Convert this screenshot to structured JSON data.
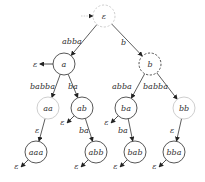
{
  "diagram": {
    "type": "tree",
    "colors": {
      "edge": "#333333",
      "node_dark": "#444444",
      "node_light": "#c8c8c8",
      "text": "#333333"
    },
    "nodes": [
      {
        "id": "eps",
        "label": "ε",
        "x": 104,
        "y": 16,
        "r": 11,
        "style": "dashed-light",
        "initial": true
      },
      {
        "id": "a",
        "label": "a",
        "x": 64,
        "y": 64,
        "r": 11,
        "style": "solid-dark",
        "final_dir": "left"
      },
      {
        "id": "b",
        "label": "b",
        "x": 150,
        "y": 64,
        "r": 11,
        "style": "dashed-dark"
      },
      {
        "id": "aa",
        "label": "aa",
        "x": 48,
        "y": 108,
        "r": 11,
        "style": "solid-light"
      },
      {
        "id": "ab",
        "label": "ab",
        "x": 82,
        "y": 108,
        "r": 11,
        "style": "solid-dark",
        "final_dir": "downleft"
      },
      {
        "id": "ba",
        "label": "ba",
        "x": 126,
        "y": 108,
        "r": 11,
        "style": "solid-dark",
        "final_dir": "downleft"
      },
      {
        "id": "bb",
        "label": "bb",
        "x": 184,
        "y": 108,
        "r": 11,
        "style": "solid-light"
      },
      {
        "id": "aaa",
        "label": "aaa",
        "x": 36,
        "y": 152,
        "r": 11,
        "style": "solid-dark",
        "final_dir": "downleft"
      },
      {
        "id": "abb",
        "label": "abb",
        "x": 96,
        "y": 152,
        "r": 11,
        "style": "solid-dark",
        "final_dir": "downleft"
      },
      {
        "id": "bab",
        "label": "bab",
        "x": 135,
        "y": 152,
        "r": 11,
        "style": "solid-dark",
        "final_dir": "downleft"
      },
      {
        "id": "bba",
        "label": "bba",
        "x": 174,
        "y": 152,
        "r": 11,
        "style": "solid-dark",
        "final_dir": "downleft"
      }
    ],
    "edges": [
      {
        "from": "eps",
        "to": "a",
        "label": "abba",
        "lx": 62,
        "ly": 44
      },
      {
        "from": "eps",
        "to": "b",
        "label": "b",
        "lx": 121,
        "ly": 45
      },
      {
        "from": "a",
        "to": "aa",
        "label": "babba",
        "lx": 30,
        "ly": 89
      },
      {
        "from": "a",
        "to": "ab",
        "label": "ba",
        "lx": 68,
        "ly": 89
      },
      {
        "from": "b",
        "to": "ba",
        "label": "abba",
        "lx": 112,
        "ly": 89
      },
      {
        "from": "b",
        "to": "bb",
        "label": "babba",
        "lx": 143,
        "ly": 89
      },
      {
        "from": "aa",
        "to": "aaa",
        "label": "ε",
        "lx": 35,
        "ly": 133
      },
      {
        "from": "ab",
        "to": "abb",
        "label": "ba",
        "lx": 79,
        "ly": 133
      },
      {
        "from": "ba",
        "to": "bab",
        "label": "ba",
        "lx": 118,
        "ly": 133
      },
      {
        "from": "bb",
        "to": "bba",
        "label": "ε",
        "lx": 170,
        "ly": 133
      }
    ],
    "final_marker_label": "ε",
    "initial_marker": "arrow-from-left"
  }
}
